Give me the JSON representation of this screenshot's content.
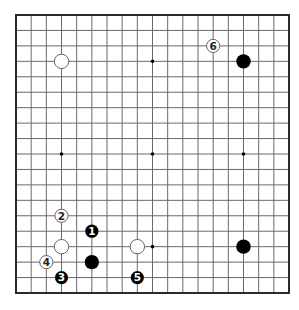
{
  "diagram": {
    "type": "go-board",
    "size": 19,
    "colors": {
      "background": "#ffffff",
      "grid_line": "#6a6a6a",
      "border": "#2a2a2a",
      "black_stone": "#000000",
      "white_stone_fill": "#ffffff",
      "white_stone_stroke": "#555555",
      "hoshi": "#000000"
    },
    "hoshi_points": [
      {
        "col": 9,
        "row": 3
      },
      {
        "col": 3,
        "row": 9
      },
      {
        "col": 9,
        "row": 9
      },
      {
        "col": 15,
        "row": 9
      },
      {
        "col": 9,
        "row": 15
      },
      {
        "col": 3,
        "row": 3
      },
      {
        "col": 15,
        "row": 3
      },
      {
        "col": 3,
        "row": 15
      },
      {
        "col": 15,
        "row": 15
      }
    ],
    "stones": [
      {
        "color": "white",
        "col": 3,
        "row": 3,
        "label": ""
      },
      {
        "color": "black",
        "col": 15,
        "row": 3,
        "label": ""
      },
      {
        "color": "white",
        "col": 13,
        "row": 2,
        "label": "6"
      },
      {
        "color": "white",
        "col": 3,
        "row": 13,
        "label": "2"
      },
      {
        "color": "black",
        "col": 5,
        "row": 14,
        "label": "1"
      },
      {
        "color": "white",
        "col": 3,
        "row": 15,
        "label": ""
      },
      {
        "color": "black",
        "col": 5,
        "row": 16,
        "label": ""
      },
      {
        "color": "white",
        "col": 2,
        "row": 16,
        "label": "4"
      },
      {
        "color": "black",
        "col": 3,
        "row": 17,
        "label": "3"
      },
      {
        "color": "white",
        "col": 8,
        "row": 15,
        "label": ""
      },
      {
        "color": "black",
        "col": 8,
        "row": 17,
        "label": "5"
      },
      {
        "color": "black",
        "col": 15,
        "row": 15,
        "label": ""
      }
    ]
  }
}
